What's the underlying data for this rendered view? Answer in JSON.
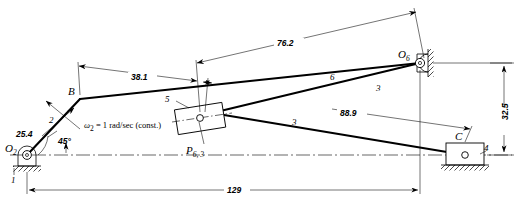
{
  "figure": {
    "type": "kinematic-linkage-diagram",
    "units_note": "millimeters",
    "joints": [
      {
        "id": "O2",
        "label_main": "O",
        "label_sub": "2",
        "x": 27,
        "y": 155,
        "kind": "fixed-pivot"
      },
      {
        "id": "B",
        "label_main": "B",
        "label_sub": "",
        "x": 80,
        "y": 99,
        "kind": "pin"
      },
      {
        "id": "P",
        "label_main": "P",
        "label_sub": "6, 3",
        "x": 200,
        "y": 118,
        "kind": "slider-pin"
      },
      {
        "id": "O6",
        "label_main": "O",
        "label_sub": "6",
        "x": 420,
        "y": 63,
        "kind": "fixed-pivot"
      },
      {
        "id": "C",
        "label_main": "C",
        "label_sub": "",
        "x": 465,
        "y": 155,
        "kind": "slider-pin"
      }
    ],
    "link_numbers": [
      {
        "id": "link-1-ground",
        "label": "1",
        "x": 14,
        "y": 180
      },
      {
        "id": "link-2-crank",
        "label": "2",
        "x": 52,
        "y": 120
      },
      {
        "id": "link-5-block",
        "label": "5",
        "x": 168,
        "y": 99
      },
      {
        "id": "link-6-upper",
        "label": "6",
        "x": 333,
        "y": 77
      },
      {
        "id": "link-3-right",
        "label": "3",
        "x": 379,
        "y": 88
      },
      {
        "id": "link-3-lower",
        "label": "3",
        "x": 295,
        "y": 122
      },
      {
        "id": "link-4-slider",
        "label": "4",
        "x": 487,
        "y": 148
      }
    ],
    "dimensions": [
      {
        "id": "dim-25-4",
        "label": "25.4",
        "x": 29,
        "y": 134
      },
      {
        "id": "dim-45-deg",
        "label": "45°",
        "x": 64,
        "y": 141
      },
      {
        "id": "dim-38-1",
        "label": "38.1",
        "x": 143,
        "y": 79
      },
      {
        "id": "dim-76-2",
        "label": "76.2",
        "x": 290,
        "y": 46
      },
      {
        "id": "dim-88-9",
        "label": "88.9",
        "x": 353,
        "y": 115
      },
      {
        "id": "dim-32-5",
        "label": "32.5",
        "x": 506,
        "y": 112
      },
      {
        "id": "dim-129",
        "label": "129",
        "x": 237,
        "y": 185
      }
    ],
    "annotations": [
      {
        "id": "omega-note",
        "omega_symbol": "ω",
        "omega_sub": "2",
        "text": " = 1 rad/sec (const.)",
        "x": 86,
        "y": 125
      }
    ],
    "colors": {
      "ink": "#000000",
      "paper": "#ffffff"
    }
  }
}
